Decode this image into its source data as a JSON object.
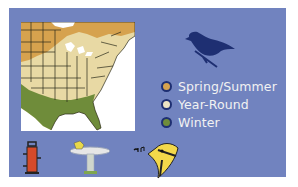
{
  "range_map": {
    "region": "Eastern United States",
    "colors": {
      "panel_background": "#7183bf",
      "spring_summer": "#d6a24e",
      "year_round": "#e8d9a4",
      "winter": "#6f8c3a",
      "bird_silhouette": "#1e2f72"
    }
  },
  "legend": {
    "items": [
      {
        "label": "Spring/Summer",
        "color": "#d6a24e"
      },
      {
        "label": "Year-Round",
        "color": "#ece3c4"
      },
      {
        "label": "Winter",
        "color": "#6f8c3a"
      }
    ]
  },
  "icons": {
    "bird": "bird-silhouette-icon",
    "feeder": "bird-feeder-icon",
    "bath": "bird-bath-icon",
    "song": "singing-bird-icon"
  }
}
